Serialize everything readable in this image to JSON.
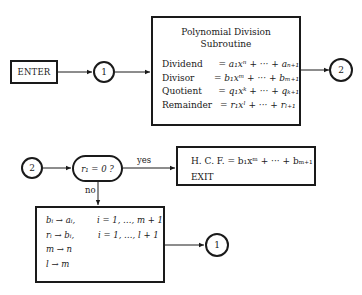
{
  "diagram": {
    "enter": {
      "label": "ENTER"
    },
    "connector_1_top": {
      "label": "1"
    },
    "connector_2_top": {
      "label": "2"
    },
    "connector_2_bottom": {
      "label": "2"
    },
    "connector_1_bottom": {
      "label": "1"
    },
    "subroutine": {
      "title_line1": "Polynomial Division",
      "title_line2": "Subroutine",
      "rows": [
        {
          "label": "Dividend",
          "value": "= a₁xⁿ + ··· + aₙ₊₁"
        },
        {
          "label": "Divisor",
          "value": "= b₁xᵐ + ··· + bₘ₊₁"
        },
        {
          "label": "Quotient",
          "value": "= q₁xᵏ + ··· + qₖ₊₁"
        },
        {
          "label": "Remainder",
          "value": "= r₁xˡ + ··· + rₗ₊₁"
        }
      ]
    },
    "decision": {
      "label": "r₁ = 0 ?",
      "yes_label": "yes",
      "no_label": "no"
    },
    "hcf_box": {
      "line1": "H. C. F. = b₁xᵐ + ··· + bₘ₊₁",
      "line2": "EXIT"
    },
    "update_box": {
      "rows": [
        {
          "left": "bᵢ → aᵢ,",
          "right": "i = 1, …, m + 1"
        },
        {
          "left": "rᵢ → bᵢ,",
          "right": "i = 1, …, l + 1"
        },
        {
          "left": "m → n",
          "right": ""
        },
        {
          "left": "l → m",
          "right": ""
        }
      ]
    },
    "colors": {
      "stroke": "#1a1a1a",
      "background": "#ffffff"
    }
  }
}
